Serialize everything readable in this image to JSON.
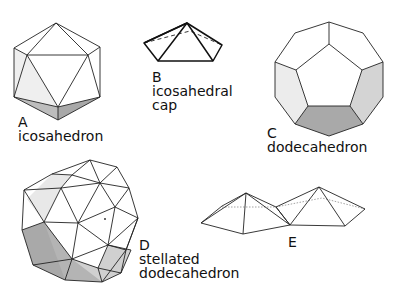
{
  "figures": [
    {
      "letter": "A",
      "name_lines": [
        "icosahedron"
      ]
    },
    {
      "letter": "B",
      "name_lines": [
        "icosahedral",
        "cap"
      ]
    },
    {
      "letter": "C",
      "name_lines": [
        "dodecahedron"
      ]
    },
    {
      "letter": "D",
      "name_lines": [
        "stellated",
        "dodecahedron"
      ]
    },
    {
      "letter": "E",
      "name_lines": []
    }
  ],
  "colors": {
    "light_shade": "#ececec",
    "mid_shade": "#cfcfcf",
    "dark_shade": "#a9a9a9",
    "line": "#222222"
  }
}
